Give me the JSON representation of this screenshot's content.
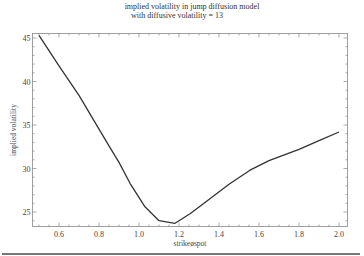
{
  "chart_data": {
    "type": "line",
    "title": "implied volatility in jump diffusion model",
    "subtitle": "with diffusive volatility = 13",
    "xlabel": "strikeøspot",
    "ylabel": "implied volatility",
    "xlim": [
      0.47,
      2.03
    ],
    "ylim": [
      23.3,
      45.6
    ],
    "xticks": [
      0.6,
      0.8,
      1.0,
      1.2,
      1.4,
      1.6,
      1.8,
      2.0
    ],
    "xtick_labels": [
      "0.6",
      "0.8",
      "1.0",
      "1.2",
      "1.4",
      "1.6",
      "1.8",
      "2.0"
    ],
    "yticks": [
      25,
      30,
      35,
      40,
      45
    ],
    "ytick_labels": [
      "25",
      "30",
      "35",
      "40",
      "45"
    ],
    "grid": false,
    "legend": null,
    "series": [
      {
        "name": "implied volatility",
        "x": [
          0.5,
          0.6,
          0.7,
          0.78,
          0.85,
          0.9,
          0.955,
          1.03,
          1.1,
          1.18,
          1.255,
          1.33,
          1.45,
          1.555,
          1.65,
          1.8,
          1.9,
          2.0
        ],
        "y": [
          45.3,
          41.8,
          38.4,
          35.3,
          32.6,
          30.7,
          28.3,
          25.6,
          24.0,
          23.7,
          24.8,
          26.1,
          28.2,
          29.8,
          30.9,
          32.2,
          33.2,
          34.2
        ]
      }
    ]
  }
}
